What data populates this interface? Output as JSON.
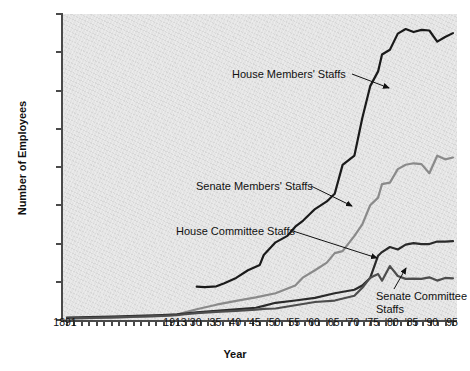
{
  "chart_data": {
    "type": "line",
    "title": "",
    "xlabel": "Year",
    "ylabel": "Number of Employees",
    "ylim": [
      0,
      8000
    ],
    "yticks": [
      0,
      1000,
      2000,
      3000,
      4000,
      5000,
      6000,
      7000,
      8000
    ],
    "ytick_labels": [
      "0",
      "1,000",
      "2,000",
      "3,000",
      "4,000",
      "5,000",
      "6,000",
      "7,000",
      "8,000"
    ],
    "xtick_labels": [
      "1891",
      "1913",
      "'30",
      "'35",
      "'40",
      "'45",
      "'50",
      "'55",
      "'60",
      "'65",
      "'70",
      "'75",
      "'80",
      "'85",
      "'90",
      "'95"
    ],
    "xtick_years": [
      1891,
      1913,
      1930,
      1935,
      1940,
      1945,
      1950,
      1955,
      1960,
      1965,
      1970,
      1975,
      1980,
      1985,
      1990,
      1995
    ],
    "xlim": [
      1891,
      1995
    ],
    "grid": false,
    "legend": "annotations",
    "series": [
      {
        "name": "House Members' Staffs",
        "color": "#1a1a1a",
        "x": [
          1930,
          1932,
          1935,
          1937,
          1940,
          1943,
          1946,
          1947,
          1950,
          1953,
          1955,
          1957,
          1960,
          1963,
          1965,
          1967,
          1970,
          1972,
          1974,
          1976,
          1977,
          1979,
          1981,
          1983,
          1985,
          1987,
          1989,
          1991,
          1993,
          1995
        ],
        "values": [
          870,
          860,
          880,
          960,
          1100,
          1300,
          1440,
          1700,
          2030,
          2200,
          2440,
          2600,
          2900,
          3100,
          3300,
          4055,
          4300,
          5280,
          6114,
          6500,
          6942,
          7067,
          7487,
          7606,
          7528,
          7584,
          7569,
          7278,
          7400,
          7500
        ]
      },
      {
        "name": "Senate Members' Staffs",
        "color": "#8a8a8a",
        "x": [
          1891,
          1900,
          1910,
          1913,
          1920,
          1930,
          1935,
          1940,
          1945,
          1950,
          1955,
          1957,
          1960,
          1963,
          1965,
          1967,
          1970,
          1972,
          1974,
          1976,
          1977,
          1979,
          1981,
          1983,
          1985,
          1987,
          1989,
          1991,
          1993,
          1995
        ],
        "values": [
          39,
          60,
          110,
          140,
          200,
          280,
          400,
          500,
          590,
          700,
          900,
          1115,
          1300,
          1500,
          1749,
          1800,
          2200,
          2500,
          3000,
          3200,
          3554,
          3593,
          3945,
          4059,
          4097,
          4075,
          3837,
          4294,
          4200,
          4247
        ]
      },
      {
        "name": "House Committee Staffs",
        "color": "#2a2a2a",
        "x": [
          1891,
          1900,
          1910,
          1913,
          1920,
          1930,
          1935,
          1940,
          1945,
          1947,
          1950,
          1955,
          1960,
          1965,
          1970,
          1972,
          1974,
          1976,
          1977,
          1979,
          1981,
          1983,
          1985,
          1987,
          1989,
          1991,
          1993,
          1995
        ],
        "values": [
          62,
          90,
          130,
          150,
          170,
          200,
          240,
          280,
          320,
          370,
          450,
          510,
          580,
          700,
          790,
          900,
          1100,
          1680,
          1776,
          1909,
          1843,
          1970,
          2009,
          1984,
          1986,
          2052,
          2050,
          2060
        ]
      },
      {
        "name": "Senate Committee Staffs",
        "color": "#4d4d4d",
        "x": [
          1891,
          1900,
          1910,
          1913,
          1920,
          1930,
          1935,
          1940,
          1945,
          1947,
          1950,
          1955,
          1960,
          1965,
          1970,
          1972,
          1974,
          1976,
          1977,
          1979,
          1981,
          1983,
          1985,
          1987,
          1989,
          1991,
          1993,
          1995
        ],
        "values": [
          41,
          70,
          110,
          130,
          150,
          180,
          210,
          240,
          270,
          290,
          300,
          386,
          470,
          509,
          635,
          844,
          1107,
          1201,
          1028,
          1410,
          1150,
          1075,
          1080,
          1074,
          1116,
          1030,
          1100,
          1090
        ]
      }
    ],
    "annotations": [
      {
        "id": "house-members",
        "text": "House Members' Staffs"
      },
      {
        "id": "senate-members",
        "text": "Senate Members' Staffs"
      },
      {
        "id": "house-committee",
        "text": "House Committee Staffs"
      },
      {
        "id": "senate-committee",
        "text": "Senate Committee Staffs"
      }
    ]
  }
}
